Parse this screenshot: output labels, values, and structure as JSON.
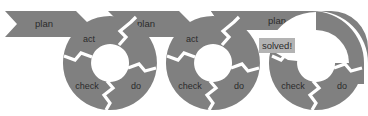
{
  "diagram": {
    "colors": {
      "cycle_gray": "#808080",
      "banner_gray": "#808080",
      "gap_white": "#ffffff",
      "text_dark": "#2b2b2b",
      "solved_box": "#b3b3b3",
      "background": "#ffffff"
    },
    "banners": [
      {
        "label": "plan",
        "name": "plan-banner-1"
      },
      {
        "label": "plan",
        "name": "plan-banner-2"
      },
      {
        "label": "plan",
        "name": "plan-banner-3"
      }
    ],
    "cycles": [
      {
        "name": "pdca-cycle-1",
        "segments": [
          {
            "key": "act",
            "label": "act"
          },
          {
            "key": "do",
            "label": "do"
          },
          {
            "key": "check",
            "label": "check"
          }
        ]
      },
      {
        "name": "pdca-cycle-2",
        "segments": [
          {
            "key": "act",
            "label": "act"
          },
          {
            "key": "do",
            "label": "do"
          },
          {
            "key": "check",
            "label": "check"
          }
        ]
      },
      {
        "name": "pdca-cycle-3",
        "segments": [
          {
            "key": "do",
            "label": "do"
          },
          {
            "key": "check",
            "label": "check"
          }
        ]
      }
    ],
    "annotation": {
      "label": "solved!",
      "name": "solved-callout"
    }
  }
}
